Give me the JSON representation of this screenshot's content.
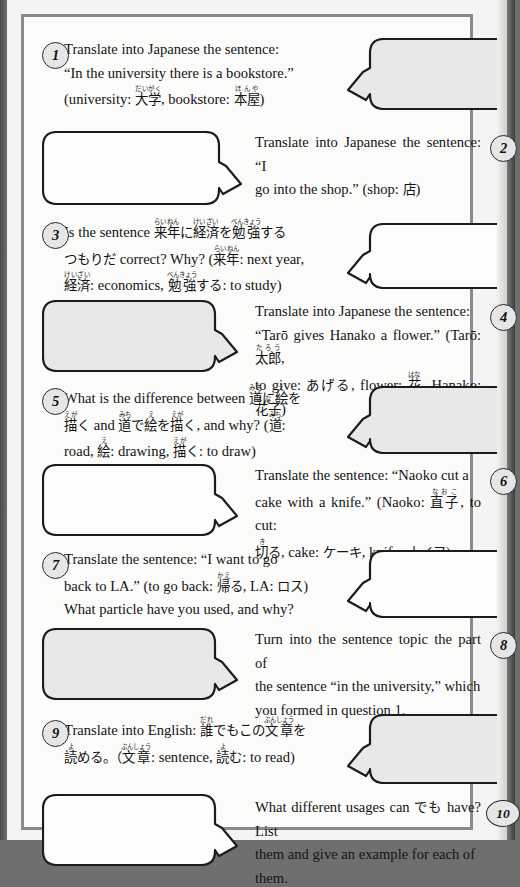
{
  "page": {
    "fill_gray": "#e8e8e8",
    "fill_white": "#fdfdfd",
    "stroke": "#1c1c1c"
  },
  "questions": [
    {
      "number": "1",
      "side": "left",
      "bubble_fill": "gray",
      "bubble_tail": "left",
      "text_plain": "Translate into Japanese the sentence: “In the university there is a bookstore.” (university: 大学, bookstore: 本屋)",
      "lines": [
        [
          {
            "t": "en",
            "v": "Translate into Japanese the sentence:"
          }
        ],
        [
          {
            "t": "en",
            "v": "“In the university there is a bookstore.”"
          }
        ],
        [
          {
            "t": "en",
            "v": "(university: "
          },
          {
            "t": "ruby",
            "v": "大学",
            "r": "だいがく"
          },
          {
            "t": "en",
            "v": ", bookstore: "
          },
          {
            "t": "ruby",
            "v": "本屋",
            "r": "ほんや"
          },
          {
            "t": "en",
            "v": ")"
          }
        ]
      ]
    },
    {
      "number": "2",
      "side": "right",
      "bubble_fill": "white",
      "bubble_tail": "right",
      "text_plain": "Translate into Japanese the sentence: “I go into the shop.” (shop: 店)",
      "lines": [
        [
          {
            "t": "en",
            "v": "Translate into Japanese the sentence: “I"
          }
        ],
        [
          {
            "t": "en",
            "v": "go into the shop.” (shop: "
          },
          {
            "t": "jp",
            "v": "店"
          },
          {
            "t": "en",
            "v": ")"
          }
        ]
      ]
    },
    {
      "number": "3",
      "side": "left",
      "bubble_fill": "white",
      "bubble_tail": "left",
      "text_plain": "Is the sentence 来年に経済を勉強するつもりだ correct? Why? (来年: next year, 経済: economics, 勉強する: to study)",
      "lines": [
        [
          {
            "t": "en",
            "v": "Is the sentence "
          },
          {
            "t": "ruby",
            "v": "来年",
            "r": "らいねん"
          },
          {
            "t": "jp",
            "v": "に"
          },
          {
            "t": "ruby",
            "v": "経済",
            "r": "けいざい"
          },
          {
            "t": "jp",
            "v": "を"
          },
          {
            "t": "ruby",
            "v": "勉強",
            "r": "べんきょう"
          },
          {
            "t": "jp",
            "v": "する"
          }
        ],
        [
          {
            "t": "jp",
            "v": "つもりだ"
          },
          {
            "t": "en",
            "v": " correct? Why? ("
          },
          {
            "t": "ruby",
            "v": "来年",
            "r": "らいねん"
          },
          {
            "t": "en",
            "v": ": next year,"
          }
        ],
        [
          {
            "t": "ruby",
            "v": "経済",
            "r": "けいざい"
          },
          {
            "t": "en",
            "v": ": economics, "
          },
          {
            "t": "ruby",
            "v": "勉強",
            "r": "べんきょう"
          },
          {
            "t": "jp",
            "v": "する"
          },
          {
            "t": "en",
            "v": ": to study)"
          }
        ]
      ]
    },
    {
      "number": "4",
      "side": "right",
      "bubble_fill": "gray",
      "bubble_tail": "right",
      "text_plain": "Translate into Japanese the sentence: “Tarō gives Hanako a flower.” (Tarō: 太郎, to give: あげる, flower: 花, Hanako: 花子)",
      "lines": [
        [
          {
            "t": "en",
            "v": "Translate into Japanese the sentence:"
          }
        ],
        [
          {
            "t": "en",
            "v": "“Tarō gives Hanako a flower.” (Tarō: "
          },
          {
            "t": "ruby",
            "v": "太郎",
            "r": "たろう"
          },
          {
            "t": "en",
            "v": ","
          }
        ],
        [
          {
            "t": "en",
            "v": "to give: "
          },
          {
            "t": "jp",
            "v": "あげる"
          },
          {
            "t": "en",
            "v": ", flower: "
          },
          {
            "t": "ruby",
            "v": "花",
            "r": "はな"
          },
          {
            "t": "en",
            "v": ", Hanako: "
          },
          {
            "t": "ruby",
            "v": "花子",
            "r": "はなこ"
          },
          {
            "t": "en",
            "v": ")"
          }
        ]
      ]
    },
    {
      "number": "5",
      "side": "left",
      "bubble_fill": "gray",
      "bubble_tail": "left",
      "text_plain": "What is the difference between 道に絵を描く and 道で絵を描く, and why? (道: road, 絵: drawing, 描く: to draw)",
      "lines": [
        [
          {
            "t": "en",
            "v": "What is the difference between "
          },
          {
            "t": "ruby",
            "v": "道",
            "r": "みち"
          },
          {
            "t": "jp",
            "v": "に"
          },
          {
            "t": "ruby",
            "v": "絵",
            "r": "え"
          },
          {
            "t": "jp",
            "v": "を"
          }
        ],
        [
          {
            "t": "ruby",
            "v": "描",
            "r": "えが"
          },
          {
            "t": "jp",
            "v": "く"
          },
          {
            "t": "en",
            "v": " and "
          },
          {
            "t": "ruby",
            "v": "道",
            "r": "みち"
          },
          {
            "t": "jp",
            "v": "で"
          },
          {
            "t": "ruby",
            "v": "絵",
            "r": "え"
          },
          {
            "t": "jp",
            "v": "を"
          },
          {
            "t": "ruby",
            "v": "描",
            "r": "えが"
          },
          {
            "t": "jp",
            "v": "く"
          },
          {
            "t": "en",
            "v": ", and why? ("
          },
          {
            "t": "ruby",
            "v": "道",
            "r": "みち"
          },
          {
            "t": "en",
            "v": ":"
          }
        ],
        [
          {
            "t": "en",
            "v": "road, "
          },
          {
            "t": "ruby",
            "v": "絵",
            "r": "え"
          },
          {
            "t": "en",
            "v": ": drawing, "
          },
          {
            "t": "ruby",
            "v": "描",
            "r": "えが"
          },
          {
            "t": "jp",
            "v": "く"
          },
          {
            "t": "en",
            "v": ": to draw)"
          }
        ]
      ]
    },
    {
      "number": "6",
      "side": "right",
      "bubble_fill": "white",
      "bubble_tail": "right",
      "text_plain": "Translate the sentence: “Naoko cut a cake with a knife.” (Naoko: 直子, to cut: 切る, cake: ケーキ, knife: ナイフ)",
      "lines": [
        [
          {
            "t": "en",
            "v": "Translate the sentence: “Naoko cut a"
          }
        ],
        [
          {
            "t": "en",
            "v": "cake with a knife.” (Naoko: "
          },
          {
            "t": "ruby",
            "v": "直子",
            "r": "なおこ"
          },
          {
            "t": "en",
            "v": ", to cut:"
          }
        ],
        [
          {
            "t": "ruby",
            "v": "切",
            "r": "き"
          },
          {
            "t": "jp",
            "v": "る"
          },
          {
            "t": "en",
            "v": ", cake: "
          },
          {
            "t": "jp",
            "v": "ケーキ"
          },
          {
            "t": "en",
            "v": ", knife: "
          },
          {
            "t": "jp",
            "v": "ナイフ"
          },
          {
            "t": "en",
            "v": ")"
          }
        ]
      ]
    },
    {
      "number": "7",
      "side": "left",
      "bubble_fill": "white",
      "bubble_tail": "left",
      "text_plain": "Translate the sentence: “I want to go back to LA.” (to go back: 帰る, LA: ロス) What particle have you used, and why?",
      "lines": [
        [
          {
            "t": "en",
            "v": "Translate the sentence: “I want to go"
          }
        ],
        [
          {
            "t": "en",
            "v": "back to LA.” (to go back: "
          },
          {
            "t": "ruby",
            "v": "帰",
            "r": "かえ"
          },
          {
            "t": "jp",
            "v": "る"
          },
          {
            "t": "en",
            "v": ", LA: "
          },
          {
            "t": "jp",
            "v": "ロス"
          },
          {
            "t": "en",
            "v": ")"
          }
        ],
        [
          {
            "t": "en",
            "v": "What particle have you used, and why?"
          }
        ]
      ]
    },
    {
      "number": "8",
      "side": "right",
      "bubble_fill": "gray",
      "bubble_tail": "right",
      "text_plain": "Turn into the sentence topic the part of the sentence “in the university,” which you formed in question 1.",
      "lines": [
        [
          {
            "t": "en",
            "v": "Turn into the sentence topic the part of"
          }
        ],
        [
          {
            "t": "en",
            "v": "the sentence “in the university,” which"
          }
        ],
        [
          {
            "t": "en",
            "v": "you formed in question 1."
          }
        ]
      ]
    },
    {
      "number": "9",
      "side": "left",
      "bubble_fill": "gray",
      "bubble_tail": "left",
      "text_plain": "Translate into English: 誰でもこの文章を読める。(文章: sentence, 読む: to read)",
      "lines": [
        [
          {
            "t": "en",
            "v": "Translate into English: "
          },
          {
            "t": "ruby",
            "v": "誰",
            "r": "だれ"
          },
          {
            "t": "jp",
            "v": "でもこの"
          },
          {
            "t": "ruby",
            "v": "文章",
            "r": "ぶんしょう"
          },
          {
            "t": "jp",
            "v": "を"
          }
        ],
        [
          {
            "t": "ruby",
            "v": "読",
            "r": "よ"
          },
          {
            "t": "jp",
            "v": "める。（"
          },
          {
            "t": "ruby",
            "v": "文章",
            "r": "ぶんしょう"
          },
          {
            "t": "en",
            "v": ": sentence, "
          },
          {
            "t": "ruby",
            "v": "読",
            "r": "よ"
          },
          {
            "t": "jp",
            "v": "む"
          },
          {
            "t": "en",
            "v": ": to read)"
          }
        ]
      ]
    },
    {
      "number": "10",
      "side": "right",
      "bubble_fill": "white",
      "bubble_tail": "right",
      "text_plain": "What different usages can でも have? List them and give an example for each of them.",
      "lines": [
        [
          {
            "t": "en",
            "v": "What different usages can "
          },
          {
            "t": "jp",
            "v": "でも"
          },
          {
            "t": "en",
            "v": " have? List"
          }
        ],
        [
          {
            "t": "en",
            "v": "them and give an example for each of"
          }
        ],
        [
          {
            "t": "en",
            "v": "them."
          }
        ]
      ]
    }
  ]
}
